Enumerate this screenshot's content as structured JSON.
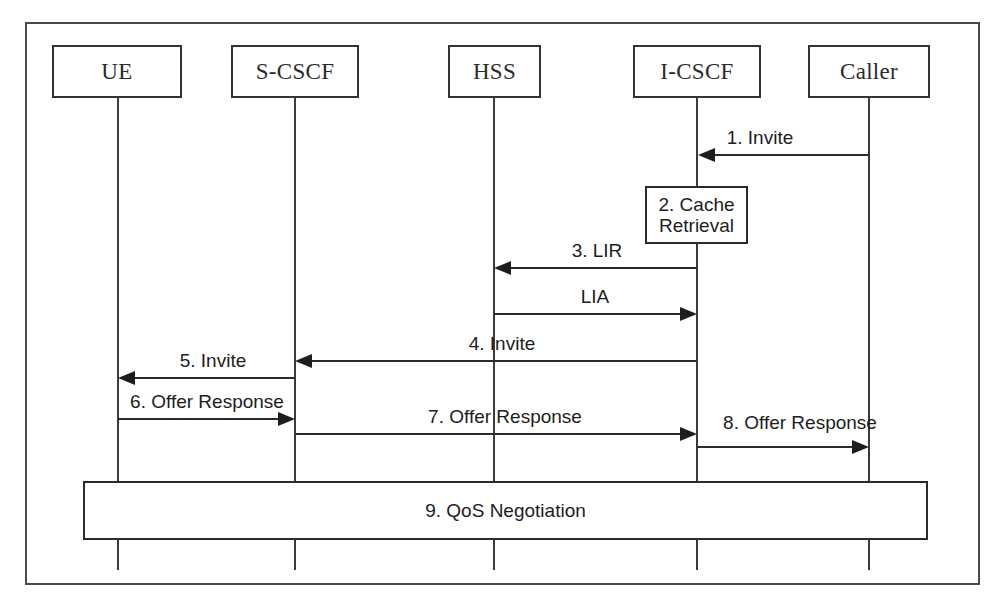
{
  "diagram": {
    "type": "uml-sequence-diagram",
    "frame": {
      "x": 25,
      "y": 22,
      "width": 955,
      "height": 563,
      "border_color": "#4a4a4a"
    },
    "background": "#ffffff",
    "line_color": "#2b2b2b"
  },
  "participants": [
    {
      "id": "ue",
      "label": "UE",
      "box": {
        "x": 52,
        "y": 45,
        "width": 130,
        "height": 53
      },
      "lifeline_x": 118,
      "lifeline_top": 98,
      "lifeline_bottom": 570
    },
    {
      "id": "scscf",
      "label": "S-CSCF",
      "box": {
        "x": 231,
        "y": 45,
        "width": 128,
        "height": 53
      },
      "lifeline_x": 295,
      "lifeline_top": 98,
      "lifeline_bottom": 570
    },
    {
      "id": "hss",
      "label": "HSS",
      "box": {
        "x": 448,
        "y": 45,
        "width": 93,
        "height": 53
      },
      "lifeline_x": 494,
      "lifeline_top": 98,
      "lifeline_bottom": 570
    },
    {
      "id": "icscf",
      "label": "I-CSCF",
      "box": {
        "x": 633,
        "y": 45,
        "width": 128,
        "height": 53
      },
      "lifeline_x": 697,
      "lifeline_top": 98,
      "lifeline_bottom": 570
    },
    {
      "id": "caller",
      "label": "Caller",
      "box": {
        "x": 808,
        "y": 45,
        "width": 122,
        "height": 53
      },
      "lifeline_x": 869,
      "lifeline_top": 98,
      "lifeline_bottom": 570
    }
  ],
  "messages": [
    {
      "seq": "1",
      "label": "1. Invite",
      "from": "caller",
      "to": "icscf",
      "direction": "left",
      "y": 155,
      "x1": 697,
      "x2": 869,
      "label_x": 760,
      "label_y": 128
    },
    {
      "seq": "3",
      "label": "3. LIR",
      "from": "icscf",
      "to": "hss",
      "direction": "left",
      "y": 268,
      "x1": 494,
      "x2": 697,
      "label_x": 560,
      "label_y": 241
    },
    {
      "seq": "",
      "label": "LIA",
      "from": "hss",
      "to": "icscf",
      "direction": "right",
      "y": 314,
      "x1": 494,
      "x2": 697,
      "label_x": 570,
      "label_y": 287
    },
    {
      "seq": "4",
      "label": "4. Invite",
      "from": "icscf",
      "to": "scscf",
      "direction": "left",
      "y": 361,
      "x1": 295,
      "x2": 697,
      "label_x": 500,
      "label_y": 334
    },
    {
      "seq": "5",
      "label": "5. Invite",
      "from": "scscf",
      "to": "ue",
      "direction": "left",
      "y": 378,
      "x1": 118,
      "x2": 295,
      "label_x": 208,
      "label_y": 351
    },
    {
      "seq": "6",
      "label": "6. Offer Response",
      "from": "ue",
      "to": "scscf",
      "direction": "right",
      "y": 419,
      "x1": 118,
      "x2": 295,
      "label_x": 207,
      "label_y": 392
    },
    {
      "seq": "7",
      "label": "7. Offer Response",
      "from": "scscf",
      "to": "icscf",
      "direction": "right",
      "y": 434,
      "x1": 295,
      "x2": 697,
      "label_x": 500,
      "label_y": 407
    },
    {
      "seq": "8",
      "label": "8. Offer Response",
      "from": "icscf",
      "to": "caller",
      "direction": "right",
      "y": 447,
      "x1": 697,
      "x2": 869,
      "label_x": 800,
      "label_y": 420
    }
  ],
  "action_box": {
    "label_line1": "2. Cache",
    "label_line2": "Retrieval",
    "label": "2. Cache Retrieval",
    "on": "icscf",
    "x": 645,
    "y": 186,
    "width": 103,
    "height": 58
  },
  "span_box": {
    "label": "9. QoS Negotiation",
    "spans_from": "ue",
    "spans_to": "caller",
    "x": 83,
    "y": 481,
    "width": 845,
    "height": 59
  }
}
